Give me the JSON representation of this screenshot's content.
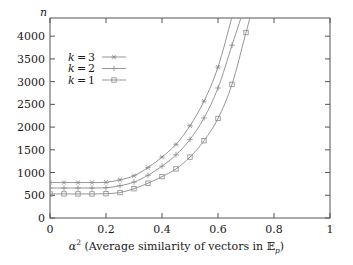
{
  "chart_data": {
    "type": "line",
    "title": "",
    "xlabel": "α² (Average similarity of vectors in ᴱₚ)",
    "xlabel_parts": {
      "alpha": "α",
      "exponent": "2",
      "text": " (Average similarity of vectors in ",
      "set_symbol": "𝔼",
      "set_subscript": "p",
      "close": ")"
    },
    "ylabel": "n",
    "xlim": [
      0,
      1
    ],
    "ylim": [
      0,
      4400
    ],
    "xticks": [
      "0",
      "0.2",
      "0.4",
      "0.6",
      "0.8",
      "1"
    ],
    "xtick_values": [
      0,
      0.2,
      0.4,
      0.6,
      0.8,
      1
    ],
    "yticks": [
      "0",
      "500",
      "1000",
      "1500",
      "2000",
      "2500",
      "3000",
      "3500",
      "4000"
    ],
    "ytick_values": [
      0,
      500,
      1000,
      1500,
      2000,
      2500,
      3000,
      3500,
      4000
    ],
    "grid": false,
    "legend_position": "upper-left-inside",
    "line_color": "#8a8a8a",
    "axis_color": "#555555",
    "x": [
      0,
      0.05,
      0.1,
      0.15,
      0.2,
      0.25,
      0.3,
      0.35,
      0.4,
      0.45,
      0.5,
      0.55,
      0.6,
      0.65,
      0.7,
      0.75
    ],
    "series": [
      {
        "name": "k = 3",
        "label_k": "k",
        "label_eq": "=",
        "label_v": "3",
        "marker": "star",
        "values": [
          780,
          780,
          780,
          780,
          785,
          840,
          930,
          1110,
          1340,
          1620,
          2030,
          2570,
          3320,
          4420,
          null,
          null
        ]
      },
      {
        "name": "k = 2",
        "label_k": "k",
        "label_eq": "=",
        "label_v": "2",
        "marker": "plus",
        "values": [
          660,
          660,
          660,
          660,
          665,
          710,
          790,
          940,
          1140,
          1390,
          1730,
          2200,
          2860,
          3800,
          null,
          null
        ]
      },
      {
        "name": "k = 1",
        "label_k": "k",
        "label_eq": "=",
        "label_v": "1",
        "marker": "square",
        "values": [
          530,
          530,
          530,
          530,
          535,
          560,
          645,
          765,
          910,
          1080,
          1340,
          1700,
          2190,
          2940,
          4080,
          null
        ]
      }
    ]
  }
}
